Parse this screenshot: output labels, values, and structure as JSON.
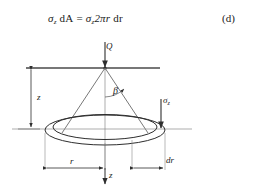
{
  "figure": {
    "equation": {
      "lhs_sigma": "σ",
      "lhs_sub": "z",
      "d_a": "dA",
      "equals": "=",
      "rhs_sigma": "σ",
      "rhs_sub": "z",
      "rhs_expr": "2πr",
      "rhs_dr": "dr",
      "full_text": "σz dA = σz 2πr dr"
    },
    "equation_label": "(d)",
    "labels": {
      "load": "Q",
      "depth": "z",
      "angle": "β",
      "stress": "σ",
      "stress_sub": "z",
      "radius": "r",
      "radius_increment": "dr",
      "depth_axis": "z"
    },
    "colors": {
      "line": "#3a3a3a",
      "thin_line": "#6e6e6e",
      "text": "#1a1a1a",
      "background": "#ffffff"
    }
  }
}
